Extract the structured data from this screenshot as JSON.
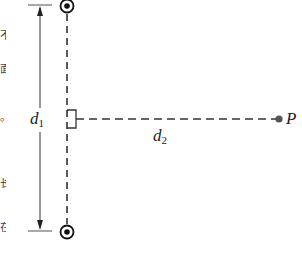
{
  "diagram": {
    "type": "physics-figure",
    "labels": {
      "d1_main": "d",
      "d1_sub": "1",
      "d2_main": "d",
      "d2_sub": "2",
      "point": "P"
    },
    "elements": {
      "top_wire": {
        "symbol": "current-out-of-page",
        "x": 67,
        "y": 6
      },
      "bottom_wire": {
        "symbol": "current-out-of-page",
        "x": 67,
        "y": 232
      },
      "point_p": {
        "x": 279,
        "y": 119
      },
      "dimension_d1": {
        "x": 40,
        "y_top": 5,
        "y_bottom": 231
      },
      "dimension_d2": {
        "x_start": 67,
        "x_end": 279,
        "y": 119
      }
    },
    "edge_text_fragments": [
      "不",
      "面",
      "。",
      "长",
      "在"
    ],
    "colors": {
      "ink": "#222222",
      "point": "#555555"
    }
  }
}
